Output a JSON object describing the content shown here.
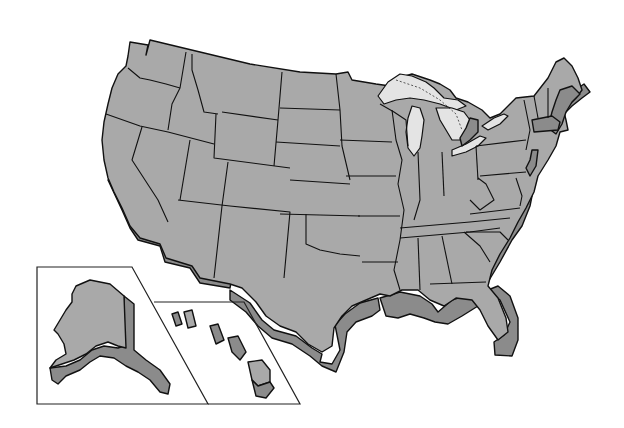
{
  "map": {
    "title": "",
    "subject": "United States (3D extruded state outline map)",
    "insets": [
      {
        "name": "Alaska",
        "position": "lower-left"
      },
      {
        "name": "Hawaii",
        "position": "lower-left, right of Alaska"
      }
    ],
    "features": [
      "contiguous-48-states",
      "great-lakes",
      "state-borders",
      "coastal-extrusion"
    ],
    "colors": {
      "land_top": "#a9a9a9",
      "land_side": "#8b8b8b",
      "lakes": "#e4e4e4",
      "border": "#111111",
      "background": "#ffffff"
    }
  }
}
